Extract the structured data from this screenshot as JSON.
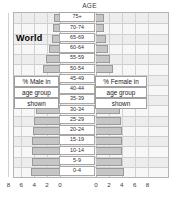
{
  "chart_data": {
    "type": "bar",
    "subtype": "population-pyramid",
    "title": "World",
    "axis_title_top": "AGE",
    "xlabel": "",
    "ylabel": "",
    "grid": true,
    "legend_position": "inline-annotation",
    "xlim": [
      -9,
      9
    ],
    "xticks_left": [
      "8",
      "6",
      "4",
      "2",
      "0"
    ],
    "xticks_right": [
      "0",
      "2",
      "4",
      "6",
      "8"
    ],
    "xtick_values_left": [
      8,
      6,
      4,
      2,
      0
    ],
    "xtick_values_right": [
      0,
      2,
      4,
      6,
      8
    ],
    "categories": [
      "75+",
      "70-74",
      "65-69",
      "60-64",
      "55-59",
      "50-54",
      "45-49",
      "40-44",
      "35-39",
      "30-34",
      "25-29",
      "20-24",
      "15-19",
      "10-14",
      "5-9",
      "0-4"
    ],
    "series": [
      {
        "name": "% Male in age group shown",
        "side": "left",
        "values": [
          1.0,
          1.1,
          1.3,
          1.7,
          2.1,
          2.6,
          2.9,
          3.2,
          3.5,
          3.7,
          4.0,
          4.2,
          4.3,
          4.3,
          4.3,
          4.5
        ]
      },
      {
        "name": "% Female in age group shown",
        "side": "right",
        "values": [
          1.3,
          1.3,
          1.5,
          1.9,
          2.2,
          2.7,
          3.0,
          3.2,
          3.5,
          3.7,
          3.9,
          4.1,
          4.1,
          4.1,
          4.1,
          4.3
        ]
      }
    ],
    "annotations": {
      "male_label_lines": [
        "% Male in",
        "age group",
        "shown"
      ],
      "female_label_lines": [
        "% Female in",
        "age group",
        "shown"
      ]
    },
    "colors": {
      "bar_fill": "#c6c6c6",
      "bar_border": "#9a9a9a",
      "band_light": "#f7f7f7",
      "band_dark": "#ededed",
      "grid": "#cfcfcf",
      "frame": "#b4b4b4",
      "text": "#2e2e2e"
    }
  },
  "labels": {
    "age_axis_title": "AGE",
    "chart_title": "World",
    "male_l1": "% Male in",
    "male_l2": "age group",
    "male_l3": "shown",
    "female_l1": "% Female in",
    "female_l2": "age group",
    "female_l3": "shown"
  }
}
